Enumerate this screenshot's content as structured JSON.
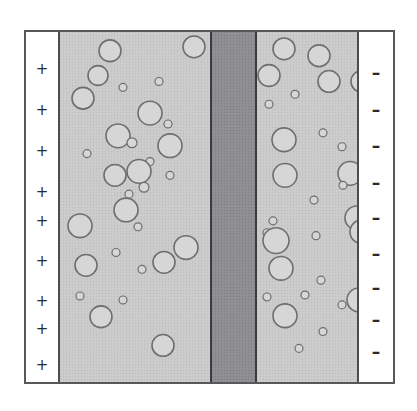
{
  "figure": {
    "type": "schematic-cross-section",
    "frame": {
      "border_color": "#58585a",
      "background": "#ffffff"
    },
    "anode": {
      "name": "positive electrode",
      "charge_symbol": "+",
      "charge_count": 9,
      "charge_positions_y": [
        30,
        71,
        112,
        153,
        182,
        222,
        262,
        290,
        326
      ],
      "fill": "#ffffff"
    },
    "cathode": {
      "name": "negative electrode",
      "charge_symbol": "–",
      "charge_count": 10,
      "charge_positions_y": [
        33,
        70,
        106,
        143,
        178,
        214,
        248,
        280,
        312,
        344
      ],
      "fill": "#ffffff"
    },
    "membrane": {
      "label": "separator / membrane",
      "fill": "#8d8d8f",
      "texture": "fine-crosshatch"
    },
    "electrolyte": {
      "label": "electrolyte with gas bubbles",
      "fill": "#c9c9c9",
      "texture": "fine-stipple",
      "bubble_fill": "#d6d6d6",
      "bubble_stroke": "#6e6e70"
    },
    "bubbles_left": [
      {
        "cx": 50,
        "cy": 19,
        "r": 11
      },
      {
        "cx": 38,
        "cy": 44,
        "r": 10
      },
      {
        "cx": 23,
        "cy": 67,
        "r": 11
      },
      {
        "cx": 134,
        "cy": 15,
        "r": 11
      },
      {
        "cx": 63,
        "cy": 56,
        "r": 4
      },
      {
        "cx": 99,
        "cy": 50,
        "r": 4
      },
      {
        "cx": 90,
        "cy": 82,
        "r": 12
      },
      {
        "cx": 108,
        "cy": 93,
        "r": 4
      },
      {
        "cx": 58,
        "cy": 105,
        "r": 12
      },
      {
        "cx": 72,
        "cy": 112,
        "r": 5
      },
      {
        "cx": 110,
        "cy": 115,
        "r": 12
      },
      {
        "cx": 27,
        "cy": 123,
        "r": 4
      },
      {
        "cx": 90,
        "cy": 131,
        "r": 4
      },
      {
        "cx": 55,
        "cy": 145,
        "r": 11
      },
      {
        "cx": 79,
        "cy": 141,
        "r": 12
      },
      {
        "cx": 110,
        "cy": 145,
        "r": 4
      },
      {
        "cx": 84,
        "cy": 157,
        "r": 5
      },
      {
        "cx": 69,
        "cy": 164,
        "r": 4
      },
      {
        "cx": 66,
        "cy": 180,
        "r": 12
      },
      {
        "cx": 20,
        "cy": 196,
        "r": 12
      },
      {
        "cx": 78,
        "cy": 197,
        "r": 4
      },
      {
        "cx": 56,
        "cy": 223,
        "r": 4
      },
      {
        "cx": 126,
        "cy": 218,
        "r": 12
      },
      {
        "cx": 104,
        "cy": 233,
        "r": 11
      },
      {
        "cx": 82,
        "cy": 240,
        "r": 4
      },
      {
        "cx": 26,
        "cy": 236,
        "r": 11
      },
      {
        "cx": 20,
        "cy": 267,
        "r": 4
      },
      {
        "cx": 63,
        "cy": 271,
        "r": 4
      },
      {
        "cx": 41,
        "cy": 288,
        "r": 11
      },
      {
        "cx": 103,
        "cy": 317,
        "r": 11
      }
    ],
    "bubbles_right": [
      {
        "cx": 27,
        "cy": 17,
        "r": 11
      },
      {
        "cx": 62,
        "cy": 24,
        "r": 11
      },
      {
        "cx": 12,
        "cy": 44,
        "r": 11
      },
      {
        "cx": 72,
        "cy": 50,
        "r": 11
      },
      {
        "cx": 105,
        "cy": 50,
        "r": 11
      },
      {
        "cx": 38,
        "cy": 63,
        "r": 4
      },
      {
        "cx": 12,
        "cy": 73,
        "r": 4
      },
      {
        "cx": 117,
        "cy": 91,
        "r": 12
      },
      {
        "cx": 27,
        "cy": 109,
        "r": 12
      },
      {
        "cx": 66,
        "cy": 102,
        "r": 4
      },
      {
        "cx": 110,
        "cy": 114,
        "r": 4
      },
      {
        "cx": 85,
        "cy": 116,
        "r": 4
      },
      {
        "cx": 28,
        "cy": 145,
        "r": 12
      },
      {
        "cx": 93,
        "cy": 143,
        "r": 12
      },
      {
        "cx": 57,
        "cy": 170,
        "r": 4
      },
      {
        "cx": 86,
        "cy": 155,
        "r": 4
      },
      {
        "cx": 16,
        "cy": 191,
        "r": 4
      },
      {
        "cx": 100,
        "cy": 188,
        "r": 12
      },
      {
        "cx": 105,
        "cy": 202,
        "r": 12
      },
      {
        "cx": 10,
        "cy": 203,
        "r": 4
      },
      {
        "cx": 19,
        "cy": 211,
        "r": 13
      },
      {
        "cx": 59,
        "cy": 206,
        "r": 4
      },
      {
        "cx": 112,
        "cy": 226,
        "r": 4
      },
      {
        "cx": 24,
        "cy": 239,
        "r": 12
      },
      {
        "cx": 64,
        "cy": 251,
        "r": 4
      },
      {
        "cx": 10,
        "cy": 268,
        "r": 4
      },
      {
        "cx": 48,
        "cy": 266,
        "r": 4
      },
      {
        "cx": 102,
        "cy": 271,
        "r": 12
      },
      {
        "cx": 85,
        "cy": 276,
        "r": 4
      },
      {
        "cx": 28,
        "cy": 287,
        "r": 12
      },
      {
        "cx": 66,
        "cy": 303,
        "r": 4
      },
      {
        "cx": 42,
        "cy": 320,
        "r": 4
      },
      {
        "cx": 112,
        "cy": 326,
        "r": 11
      }
    ]
  }
}
